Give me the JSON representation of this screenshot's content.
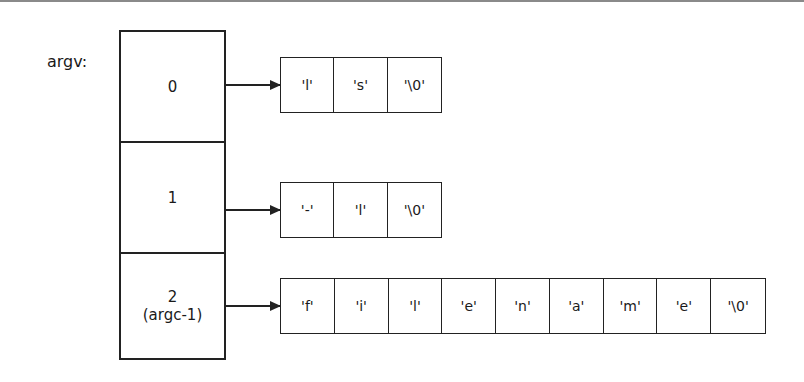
{
  "diagram": {
    "pointer_label": "argv:",
    "slots": [
      {
        "index": "0",
        "sublabel": ""
      },
      {
        "index": "1",
        "sublabel": ""
      },
      {
        "index": "2",
        "sublabel": "(argc-1)"
      }
    ],
    "strings": [
      {
        "cells": [
          "'l'",
          "'s'",
          "'\\0'"
        ]
      },
      {
        "cells": [
          "'-'",
          "'l'",
          "'\\0'"
        ]
      },
      {
        "cells": [
          "'f'",
          "'i'",
          "'l'",
          "'e'",
          "'n'",
          "'a'",
          "'m'",
          "'e'",
          "'\\0'"
        ]
      }
    ],
    "colors": {
      "line": "#222222",
      "background": "#ffffff"
    }
  }
}
